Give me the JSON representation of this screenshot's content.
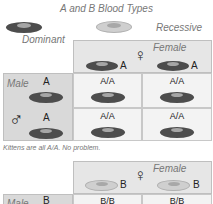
{
  "title": "A and B Blood Types",
  "legend": {
    "dominant_label": "Dominant",
    "recessive_label": "Recessive",
    "dominant_color": "#4d4d4d",
    "recessive_color": "#cfcfcf"
  },
  "square1": {
    "female_label": "Female",
    "female_symbol": "♀",
    "female_alleles": [
      "A",
      "A"
    ],
    "male_label": "Male",
    "male_symbol": "♂",
    "male_alleles": [
      "A",
      "A"
    ],
    "cells": [
      [
        "A/A",
        "A/A"
      ],
      [
        "A/A",
        "A/A"
      ]
    ],
    "note": "Kittens are all A/A. No problem."
  },
  "square2": {
    "female_label": "Female",
    "female_symbol": "♀",
    "female_alleles": [
      "B",
      "B"
    ],
    "male_label": "Male",
    "male_alleles": [
      "B"
    ],
    "cells": [
      [
        "B/B",
        "B/B"
      ]
    ]
  }
}
